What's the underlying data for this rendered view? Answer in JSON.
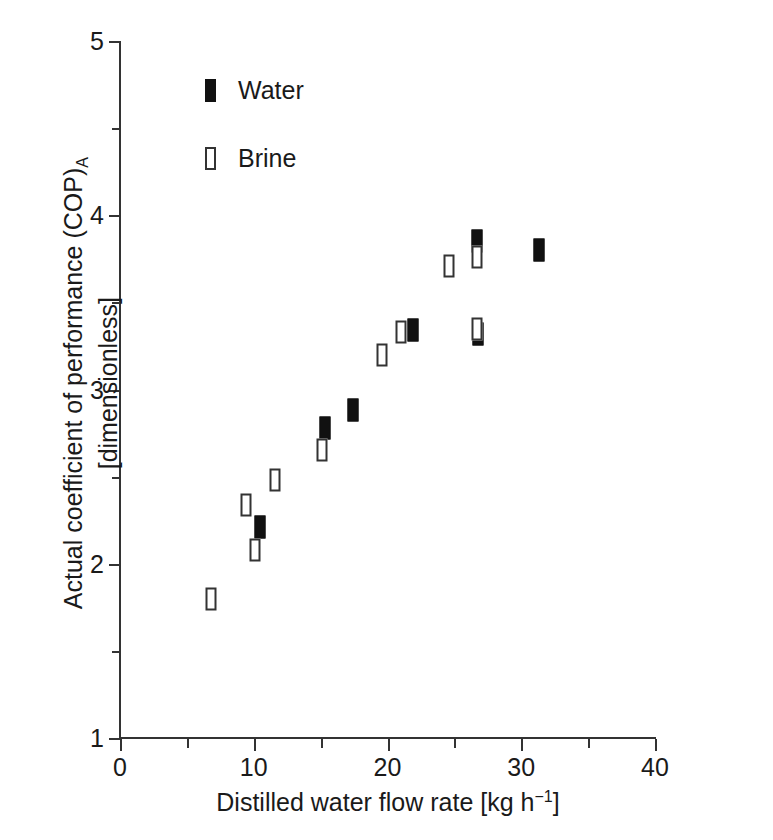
{
  "chart_data": {
    "type": "scatter",
    "title": "",
    "xlabel": "Distilled water flow rate [kg h⁻¹]",
    "ylabel": "Actual coefficient of performance (COP)A [dimensionless]",
    "xlim": [
      0,
      40
    ],
    "ylim": [
      1,
      5
    ],
    "grid": false,
    "legend_position": "top-left-inside",
    "x_ticks_major": [
      0,
      10,
      20,
      30,
      40
    ],
    "x_ticks_minor": [
      5,
      15,
      25,
      35
    ],
    "x_tick_labels": [
      "0",
      "10",
      "20",
      "30",
      "40"
    ],
    "y_ticks_major": [
      1,
      2,
      3,
      4,
      5
    ],
    "y_ticks_minor": [
      1.5,
      2.5,
      3.5,
      4.5
    ],
    "y_tick_labels": [
      "1",
      "2",
      "3",
      "4",
      "5"
    ],
    "series": [
      {
        "name": "Water",
        "marker": "filled-vertical-rectangle",
        "color": "#111111",
        "points": [
          {
            "x": 10.5,
            "y": 2.21
          },
          {
            "x": 15.3,
            "y": 2.78
          },
          {
            "x": 17.4,
            "y": 2.88
          },
          {
            "x": 21.9,
            "y": 3.34
          },
          {
            "x": 26.7,
            "y": 3.85
          },
          {
            "x": 26.8,
            "y": 3.32
          },
          {
            "x": 31.3,
            "y": 3.8
          }
        ]
      },
      {
        "name": "Brine",
        "marker": "open-vertical-rectangle",
        "color": "#333333",
        "points": [
          {
            "x": 6.8,
            "y": 1.8
          },
          {
            "x": 9.4,
            "y": 2.34
          },
          {
            "x": 10.1,
            "y": 2.08
          },
          {
            "x": 11.6,
            "y": 2.48
          },
          {
            "x": 15.1,
            "y": 2.65
          },
          {
            "x": 19.6,
            "y": 3.2
          },
          {
            "x": 21.0,
            "y": 3.33
          },
          {
            "x": 24.6,
            "y": 3.71
          },
          {
            "x": 26.7,
            "y": 3.76
          },
          {
            "x": 26.7,
            "y": 3.35
          }
        ]
      }
    ]
  },
  "axes": {
    "x_title_main": "Distilled water flow rate [kg h",
    "x_title_sup": "−1",
    "x_title_tail": "]",
    "y_title_line1_main": "Actual coefficient of performance (COP)",
    "y_title_line1_sub": "A",
    "y_title_line2": "[dimensionless]"
  },
  "legend": {
    "entries": [
      {
        "label": "Water",
        "style": "water"
      },
      {
        "label": "Brine",
        "style": "brine"
      }
    ]
  }
}
